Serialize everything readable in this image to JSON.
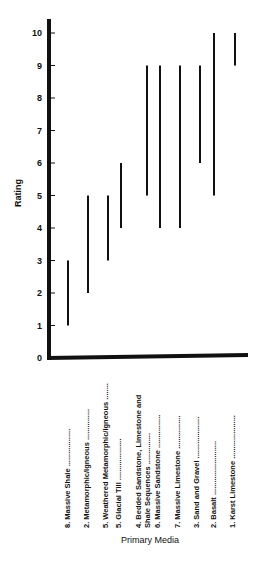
{
  "chart_data": {
    "type": "bar",
    "subtype": "floating-range",
    "title": "",
    "xlabel": "Primary Media",
    "ylabel": "Rating",
    "ylim": [
      0,
      10
    ],
    "yticks": [
      0,
      1,
      2,
      3,
      4,
      5,
      6,
      7,
      8,
      9,
      10
    ],
    "grid": false,
    "legend": null,
    "categories": [
      "8. Massive Shale",
      "2. Metamorphic/Igneous",
      "5. Weathered Metamorphic/Igneous",
      "5. Glacial Till",
      "4. Bedded Sandstone, Limestone and Shale Sequences",
      "6. Massive Sandstone",
      "7. Massive Limestone",
      "3. Sand and Gravel",
      "2. Basalt",
      "1. Karst Limestone"
    ],
    "series": [
      {
        "name": "min",
        "values": [
          1,
          2,
          3,
          4,
          5,
          4,
          4,
          6,
          5,
          9
        ]
      },
      {
        "name": "max",
        "values": [
          3,
          5,
          5,
          6,
          9,
          9,
          9,
          9,
          10,
          10
        ]
      }
    ]
  },
  "labels": {
    "ylabel": "Rating",
    "xlabel": "Primary Media",
    "categories": [
      {
        "line1": "8.  Massive Shale ..................",
        "line2": ""
      },
      {
        "line1": "2.  Metamorphic/Igneous ...............",
        "line2": ""
      },
      {
        "line1": "5.  Weathered Metamorphic/Igneous ........",
        "line2": ""
      },
      {
        "line1": "5.  Glacial Till ....................",
        "line2": ""
      },
      {
        "line1": "4.  Bedded Sandstone, Limestone and",
        "line2": "     Shale Sequences ..............."
      },
      {
        "line1": "6.  Massive Sandstone ................",
        "line2": ""
      },
      {
        "line1": "7.  Massive Limestone ................",
        "line2": ""
      },
      {
        "line1": "3.  Sand and Gravel ....................",
        "line2": ""
      },
      {
        "line1": "2.  Basalt ..........................",
        "line2": ""
      },
      {
        "line1": "1.  Karst Limestone .....................",
        "line2": ""
      }
    ],
    "yticks": [
      "0",
      "1",
      "2",
      "3",
      "4",
      "5",
      "6",
      "7",
      "8",
      "9",
      "10"
    ]
  },
  "colors": {
    "ink": "#111111",
    "background": "#ffffff"
  }
}
